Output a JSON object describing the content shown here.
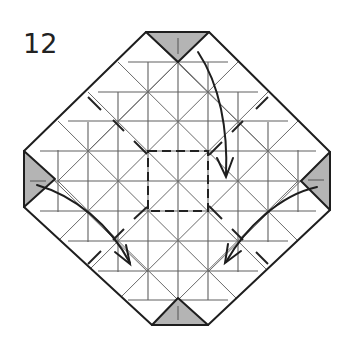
{
  "step": {
    "number": "12"
  },
  "diagram": {
    "type": "origami-crease-pattern",
    "outline": {
      "points": [
        [
          146,
          32
        ],
        [
          209,
          32
        ],
        [
          330,
          152
        ],
        [
          330,
          210
        ],
        [
          208,
          325
        ],
        [
          152,
          325
        ],
        [
          24,
          207
        ],
        [
          24,
          151
        ]
      ],
      "stroke": "#1e1e1e"
    },
    "flaps": [
      {
        "name": "top",
        "points": [
          [
            146,
            32
          ],
          [
            209,
            32
          ],
          [
            178,
            62
          ]
        ]
      },
      {
        "name": "left",
        "points": [
          [
            24,
            151
          ],
          [
            24,
            207
          ],
          [
            55,
            179
          ]
        ]
      },
      {
        "name": "right",
        "points": [
          [
            330,
            152
          ],
          [
            330,
            210
          ],
          [
            301,
            181
          ]
        ]
      },
      {
        "name": "bottom",
        "points": [
          [
            152,
            325
          ],
          [
            208,
            325
          ],
          [
            178,
            298
          ]
        ]
      }
    ],
    "flap_color": "#b4b4b4",
    "grid": {
      "center": [
        178,
        180
      ],
      "spacing": 30,
      "line_color": "#555555"
    },
    "dashed_square": {
      "x": 148,
      "y": 151,
      "w": 60,
      "h": 60
    },
    "arrows": [
      {
        "name": "top-to-center",
        "from": [
          198,
          52
        ],
        "to": [
          226,
          176
        ]
      },
      {
        "name": "left-to-lower-left",
        "from": [
          36,
          185
        ],
        "to": [
          130,
          262
        ]
      },
      {
        "name": "right-to-lower-right",
        "from": [
          317,
          186
        ],
        "to": [
          226,
          262
        ]
      }
    ]
  }
}
